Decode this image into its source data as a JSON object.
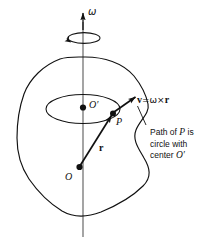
{
  "figure": {
    "background_color": "#ffffff",
    "stroke_color": "#111111",
    "axis_color": "#555555",
    "labels": {
      "omega": "ω",
      "o_prime": "O′",
      "o": "O",
      "p": "P",
      "r": "r",
      "v_vector": "v",
      "v_equals": "=",
      "v_omega": "ω",
      "v_cross": "×",
      "v_r": "r"
    },
    "caption": {
      "line1_pre": "Path of ",
      "line1_italic": "P",
      "line1_post": " is",
      "line2": "circle with",
      "line3_pre": "center ",
      "line3_italic": "O′"
    },
    "points": {
      "origin_label": "O",
      "center_label": "O′",
      "point_label": "P"
    },
    "elements": {
      "body_outline": "irregular-closed-blob",
      "rotation_axis": "vertical-line-with-arrow",
      "spin_indicator": "small-ellipse-with-arrowhead",
      "circular_path": "ellipse-through-P",
      "radius_vector": "arrow-O-to-P",
      "velocity_vector": "arrow-P-outward"
    }
  }
}
